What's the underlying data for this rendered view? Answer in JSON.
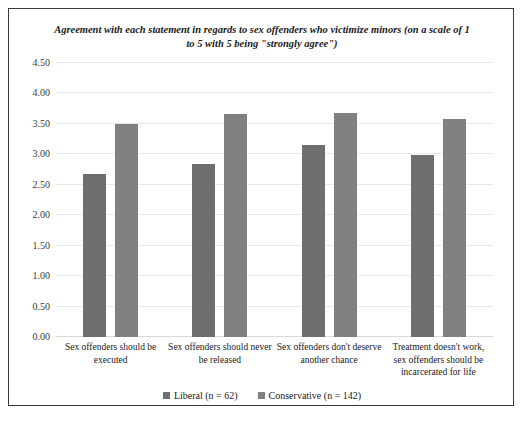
{
  "chart_data": {
    "type": "bar",
    "title": "Agreement with each statement in regards to sex offenders who victimize minors (on a scale of 1 to 5 with 5 being \"strongly agree\")",
    "xlabel": "",
    "ylabel": "",
    "ylim": [
      0.0,
      4.5
    ],
    "ytick_labels": [
      "0.00",
      "0.50",
      "1.00",
      "1.50",
      "2.00",
      "2.50",
      "3.00",
      "3.50",
      "4.00",
      "4.50"
    ],
    "ytick_values": [
      0.0,
      0.5,
      1.0,
      1.5,
      2.0,
      2.5,
      3.0,
      3.5,
      4.0,
      4.5
    ],
    "grid": true,
    "legend_position": "bottom",
    "categories": [
      "Sex offenders should be executed",
      "Sex offenders should never be released",
      "Sex offenders don't deserve another chance",
      "Treatment doesn't work, sex offenders should be incarcerated for life"
    ],
    "series": [
      {
        "name": "Liberal (n = 62)",
        "color": "#6e6e6e",
        "values": [
          2.68,
          2.84,
          3.16,
          2.99
        ]
      },
      {
        "name": "Conservative (n = 142)",
        "color": "#808080",
        "values": [
          3.5,
          3.67,
          3.68,
          3.58
        ]
      }
    ]
  }
}
